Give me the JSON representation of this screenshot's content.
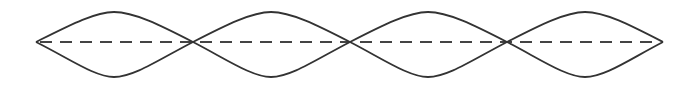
{
  "diagram": {
    "type": "standing-wave",
    "loops": 4,
    "nodes_x": [
      36,
      193,
      350,
      507,
      663
    ],
    "axis_y": 42,
    "amplitude": 32,
    "stroke_color": "#333333",
    "dash_color": "#444444",
    "labels": []
  }
}
